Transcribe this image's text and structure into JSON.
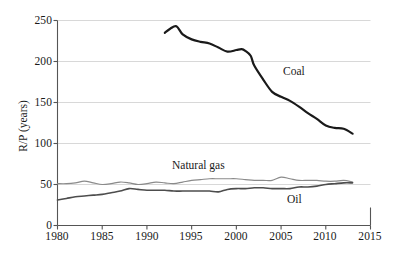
{
  "chart_data": {
    "type": "line",
    "title": "",
    "xlabel": "",
    "ylabel": "R/P (years)",
    "xlim": [
      1980,
      2015
    ],
    "ylim": [
      0,
      250
    ],
    "grid": "horizontal",
    "legend_position": "inline-annotations",
    "xticks": [
      "1980",
      "1985",
      "1990",
      "1995",
      "2000",
      "2005",
      "2010",
      "2015"
    ],
    "yticks": [
      "0",
      "50",
      "100",
      "150",
      "200",
      "250"
    ],
    "series": [
      {
        "name": "Coal",
        "color": "#1a1a1a",
        "width": 2.2,
        "x": [
          1992,
          1992.6,
          1993.3,
          1994,
          1995,
          1996,
          1997,
          1998,
          1999,
          2000,
          2000.6,
          2001,
          2001.6,
          2002,
          2003,
          2004,
          2005,
          2006,
          2007,
          2008,
          2009,
          2010,
          2011,
          2012,
          2013
        ],
        "values": [
          235,
          240,
          243,
          233,
          227,
          224,
          222,
          217,
          212,
          214,
          215,
          213,
          207,
          195,
          178,
          163,
          157,
          152,
          145,
          137,
          130,
          122,
          119,
          118,
          112
        ]
      },
      {
        "name": "Natural gas",
        "color": "#8a8a8a",
        "width": 1.2,
        "x": [
          1980,
          1981,
          1982,
          1983,
          1984,
          1985,
          1986,
          1987,
          1988,
          1989,
          1990,
          1991,
          1992,
          1993,
          1994,
          1995,
          1996,
          1997,
          1998,
          1999,
          2000,
          2001,
          2002,
          2003,
          2004,
          2005,
          2006,
          2007,
          2008,
          2009,
          2010,
          2011,
          2012,
          2013
        ],
        "values": [
          51,
          51,
          52,
          54,
          52,
          50,
          51,
          53,
          52,
          50,
          51,
          53,
          52,
          51,
          53,
          55,
          56,
          57,
          57,
          57,
          57,
          56,
          55,
          55,
          55,
          59,
          57,
          55,
          55,
          55,
          54,
          54,
          55,
          53
        ]
      },
      {
        "name": "Oil",
        "color": "#4d4d4d",
        "width": 1.6,
        "x": [
          1980,
          1981,
          1982,
          1983,
          1984,
          1985,
          1986,
          1987,
          1988,
          1989,
          1990,
          1991,
          1992,
          1993,
          1994,
          1995,
          1996,
          1997,
          1998,
          1999,
          2000,
          2001,
          2002,
          2003,
          2004,
          2005,
          2006,
          2007,
          2008,
          2009,
          2010,
          2011,
          2012,
          2013
        ],
        "values": [
          31,
          33,
          35,
          36,
          37,
          38,
          40,
          42,
          45,
          44,
          43,
          43,
          43,
          42,
          42,
          42,
          42,
          42,
          41,
          44,
          45,
          45,
          46,
          46,
          45,
          45,
          45,
          47,
          47,
          48,
          50,
          51,
          52,
          52
        ]
      }
    ],
    "annotations": [
      {
        "text": "Coal",
        "x": 2007.2,
        "y": 185
      },
      {
        "text": "Natural gas",
        "x": 1997.0,
        "y": 83
      },
      {
        "text": "Oil",
        "x": 2007.8,
        "y": 43
      }
    ]
  },
  "axes": {
    "y_label": "R/P (years)",
    "y_tick_0": "0",
    "y_tick_50": "50",
    "y_tick_100": "100",
    "y_tick_150": "150",
    "y_tick_200": "200",
    "y_tick_250": "250",
    "x_tick_1980": "1980",
    "x_tick_1985": "1985",
    "x_tick_1990": "1990",
    "x_tick_1995": "1995",
    "x_tick_2000": "2000",
    "x_tick_2005": "2005",
    "x_tick_2010": "2010",
    "x_tick_2015": "2015"
  },
  "labels": {
    "coal": "Coal",
    "natural_gas": "Natural gas",
    "oil": "Oil"
  },
  "caption": {
    "text": ""
  },
  "colors": {
    "coal": "#1a1a1a",
    "natural_gas": "#8a8a8a",
    "oil": "#4d4d4d",
    "axis": "#555555",
    "grid": "#d8d8d8",
    "text": "#1a1a1a"
  }
}
